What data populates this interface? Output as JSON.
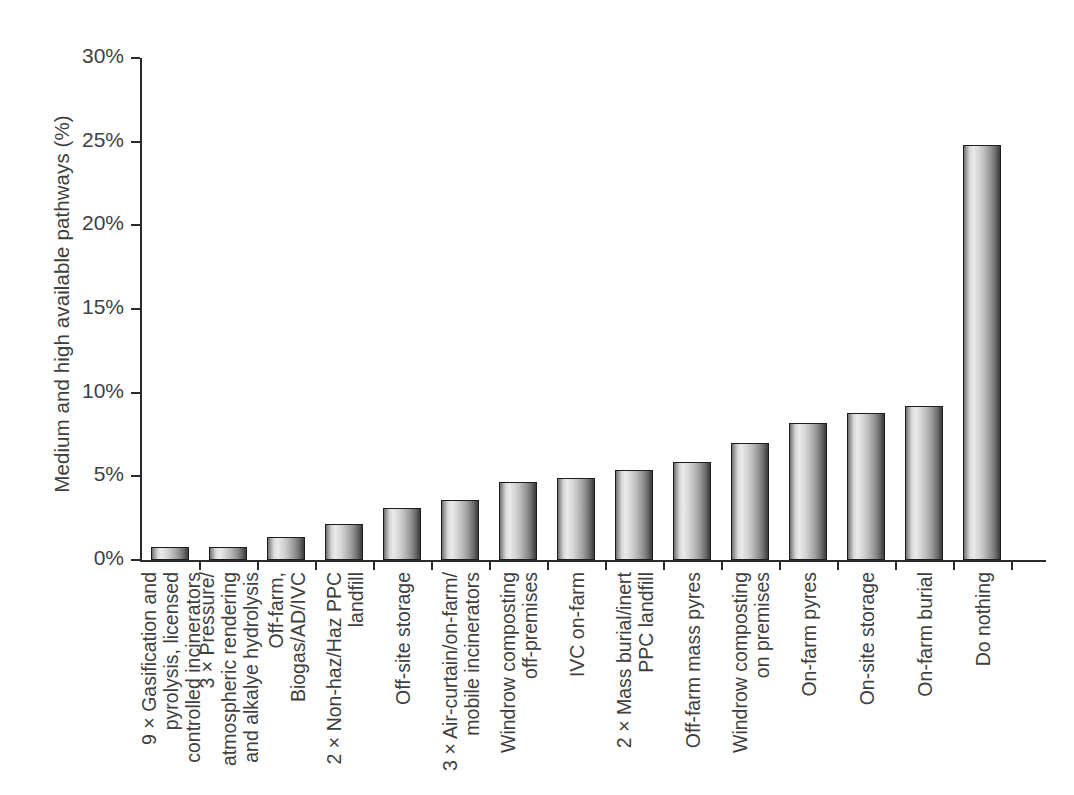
{
  "chart_data": {
    "type": "bar",
    "title": "",
    "xlabel": "",
    "ylabel": "Medium and high available pathways (%)",
    "ylim": [
      0,
      30
    ],
    "ytick_labels": [
      "0%",
      "5%",
      "10%",
      "15%",
      "20%",
      "25%",
      "30%"
    ],
    "ytick_values": [
      0,
      5,
      10,
      15,
      20,
      25,
      30
    ],
    "grid": false,
    "legend": "none",
    "categories": [
      "9 × Gasification and\npyrolysis, licensed\ncontrolled incinerators",
      "3 × Pressure/\natmospheric rendering\nand alkalye hydrolysis",
      "Off-farm,\nBiogas/AD/IVC",
      "2 × Non-haz/Haz PPC\nlandfill",
      "Off-site storage",
      "3 × Air-curtain/on-farm/\nmobile incinerators",
      "Windrow composting\noff-premises",
      "IVC on-farm",
      "2 × Mass burial/inert\nPPC landfill",
      "Off-farm mass pyres",
      "Windrow composting\non premises",
      "On-farm pyres",
      "On-site storage",
      "On-farm burial",
      "Do nothing"
    ],
    "values": [
      0.8,
      0.8,
      1.35,
      2.15,
      3.1,
      3.6,
      4.65,
      4.9,
      5.4,
      5.85,
      7.0,
      8.2,
      8.8,
      9.2,
      24.8
    ],
    "bar_style": {
      "edge_color": "#1e1e1e",
      "fill": "horizontal-gradient-grey",
      "fill_light": "#eaeaea",
      "fill_dark": "#3b3b3b"
    },
    "axis_color": "#2b2b2b",
    "text_color": "#3f3f3f",
    "background": "#ffffff"
  }
}
